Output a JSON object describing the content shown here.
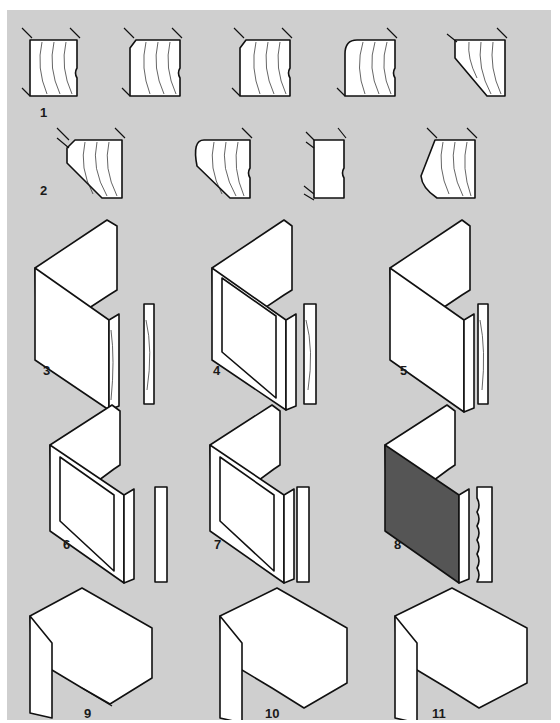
{
  "figure": {
    "title": "",
    "background": "#cfcfcf",
    "line_color": "#111111",
    "labels": [
      {
        "id": "1",
        "text": "1",
        "description": "square edge profile variants (5 profiles)"
      },
      {
        "id": "2",
        "text": "2",
        "description": "chamfered / rounded edge profile variants (4 profiles)"
      },
      {
        "id": "3",
        "text": "3",
        "description": "flat panel with applied edging"
      },
      {
        "id": "4",
        "text": "4",
        "description": "bevelled frame panel"
      },
      {
        "id": "5",
        "text": "5",
        "description": "flat panel with rounded edge"
      },
      {
        "id": "6",
        "text": "6",
        "description": "framed panel with groove inlay"
      },
      {
        "id": "7",
        "text": "7",
        "description": "framed panel with beaded inlay"
      },
      {
        "id": "8",
        "text": "8",
        "description": "reeded / fluted panel"
      },
      {
        "id": "9",
        "text": "9",
        "description": "cornice moulding with bead"
      },
      {
        "id": "10",
        "text": "10",
        "description": "cornice moulding with double bead"
      },
      {
        "id": "11",
        "text": "11",
        "description": "cornice moulding with cove"
      }
    ]
  }
}
